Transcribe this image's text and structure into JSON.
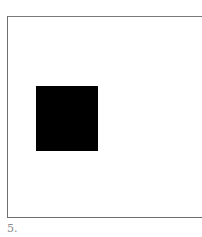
{
  "figure": {
    "label": "5.",
    "frame": {
      "border_color": "#6e6e6e",
      "right_edge_open": true
    },
    "square": {
      "color": "#000000",
      "description": "solid black square"
    }
  }
}
